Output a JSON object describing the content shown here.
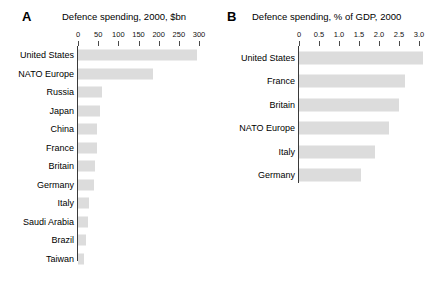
{
  "figure": {
    "background": "#ffffff",
    "bar_color": "#dcdcdc",
    "axis_color": "#3a3a3a"
  },
  "panels": [
    {
      "letter": "A",
      "title": "Defence spending, 2000, $bn"
    },
    {
      "letter": "B",
      "title": "Defence spending, % of GDP, 2000"
    }
  ],
  "chart_data": [
    {
      "type": "bar",
      "orientation": "horizontal",
      "panel": "A",
      "title": "Defence spending, 2000, $bn",
      "xlabel": "",
      "ylabel": "",
      "xlim": [
        0,
        300
      ],
      "xticks": [
        0,
        50,
        100,
        150,
        200,
        250,
        300
      ],
      "xticklabels": [
        "0",
        "50",
        "100",
        "150",
        "200",
        "250",
        "300"
      ],
      "grid": false,
      "legend": "none",
      "categories": [
        "United States",
        "NATO Europe",
        "Russia",
        "Japan",
        "China",
        "France",
        "Britain",
        "Germany",
        "Italy",
        "Saudi Arabia",
        "Brazil",
        "Taiwan"
      ],
      "values": [
        295,
        185,
        60,
        55,
        48,
        46,
        43,
        40,
        28,
        25,
        20,
        15
      ]
    },
    {
      "type": "bar",
      "orientation": "horizontal",
      "panel": "B",
      "title": "Defence spending, % of GDP, 2000",
      "xlabel": "",
      "ylabel": "",
      "xlim": [
        0,
        3.0
      ],
      "xticks": [
        0,
        0.5,
        1.0,
        1.5,
        2.0,
        2.5,
        3.0
      ],
      "xticklabels": [
        "0",
        "0.5",
        "1.0",
        "1.5",
        "2.0",
        "2.5",
        "3.0"
      ],
      "grid": false,
      "legend": "none",
      "categories": [
        "United States",
        "France",
        "Britain",
        "NATO Europe",
        "Italy",
        "Germany"
      ],
      "values": [
        3.1,
        2.65,
        2.5,
        2.25,
        1.9,
        1.55
      ]
    }
  ]
}
